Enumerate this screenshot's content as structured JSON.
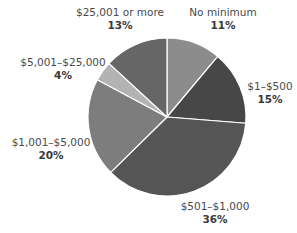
{
  "chart_data": {
    "type": "pie",
    "title": "",
    "categories": [
      "No minimum",
      "$1–$500",
      "$501–$1,000",
      "$1,001–$5,000",
      "$5,001–$25,000",
      "$25,001 or more"
    ],
    "values": [
      11,
      15,
      36,
      20,
      4,
      13
    ],
    "unit": "%",
    "start_angle_deg": 0,
    "direction": "clockwise",
    "colors": [
      "#8c8c8c",
      "#474747",
      "#555555",
      "#7d7d7d",
      "#b3b3b3",
      "#666666"
    ],
    "separator_color": "#ffffff",
    "legend": "none (direct labels)"
  },
  "labels": [
    {
      "name": "No minimum",
      "pct": "11%"
    },
    {
      "name": "$1–$500",
      "pct": "15%"
    },
    {
      "name": "$501–$1,000",
      "pct": "36%"
    },
    {
      "name": "$1,001–$5,000",
      "pct": "20%"
    },
    {
      "name": "$5,001–$25,000",
      "pct": "4%"
    },
    {
      "name": "$25,001 or more",
      "pct": "13%"
    }
  ]
}
